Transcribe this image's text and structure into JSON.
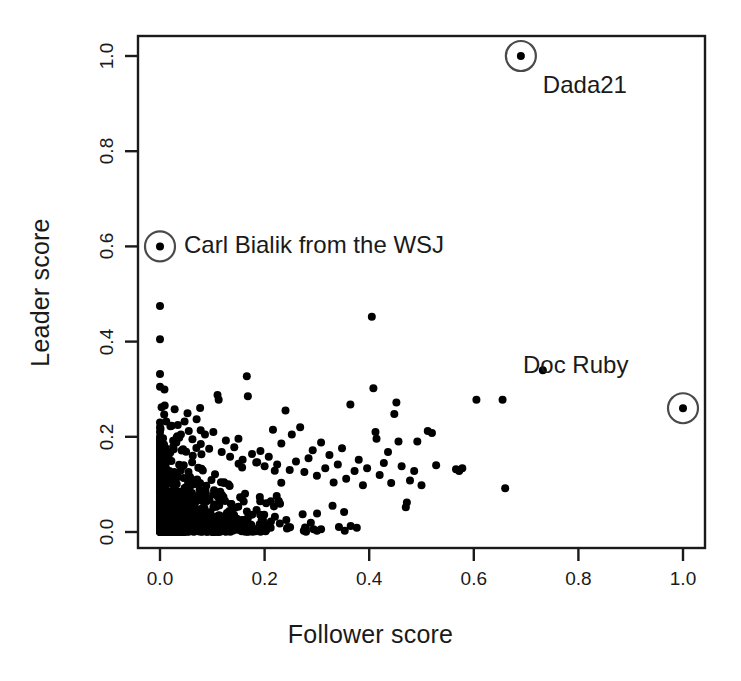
{
  "chart_data": {
    "type": "scatter",
    "title": "",
    "xlabel": "Follower score",
    "ylabel": "Leader score",
    "xlim": [
      -0.04,
      1.04
    ],
    "ylim": [
      -0.04,
      1.04
    ],
    "xticks": [
      "0.0",
      "0.2",
      "0.4",
      "0.6",
      "0.8",
      "1.0"
    ],
    "xtick_values": [
      0.0,
      0.2,
      0.4,
      0.6,
      0.8,
      1.0
    ],
    "yticks": [
      "0.0",
      "0.2",
      "0.4",
      "0.6",
      "0.8",
      "1.0"
    ],
    "ytick_values": [
      0.0,
      0.2,
      0.4,
      0.6,
      0.8,
      1.0
    ],
    "grid": false,
    "legend": "none",
    "marker": "filled-circle",
    "marker_color": "#000000",
    "frame_color": "#1a1a1a",
    "background": "#ffffff",
    "annotations": [
      {
        "label": "Dada21",
        "x": 0.69,
        "y": 1.0,
        "circled": true,
        "label_dx": 22,
        "label_dy": 30
      },
      {
        "label": "Carl Bialik from the WSJ",
        "x": 0.0,
        "y": 0.6,
        "circled": true,
        "label_dx": 24,
        "label_dy": 0
      },
      {
        "label": "Doc Ruby",
        "x": 1.0,
        "y": 0.26,
        "circled": true,
        "label_dx": -160,
        "label_dy": -42
      }
    ],
    "points": [
      [
        0.0,
        0.475
      ],
      [
        0.0,
        0.405
      ],
      [
        0.0,
        0.332
      ],
      [
        0.0,
        0.305
      ],
      [
        0.003,
        0.262
      ],
      [
        0.008,
        0.247
      ],
      [
        0.012,
        0.232
      ],
      [
        0.02,
        0.222
      ],
      [
        0.028,
        0.258
      ],
      [
        0.034,
        0.225
      ],
      [
        0.04,
        0.205
      ],
      [
        0.047,
        0.232
      ],
      [
        0.055,
        0.212
      ],
      [
        0.062,
        0.195
      ],
      [
        0.07,
        0.237
      ],
      [
        0.078,
        0.185
      ],
      [
        0.086,
        0.205
      ],
      [
        0.094,
        0.175
      ],
      [
        0.102,
        0.21
      ],
      [
        0.11,
        0.288
      ],
      [
        0.118,
        0.168
      ],
      [
        0.126,
        0.192
      ],
      [
        0.134,
        0.158
      ],
      [
        0.142,
        0.178
      ],
      [
        0.15,
        0.196
      ],
      [
        0.158,
        0.152
      ],
      [
        0.166,
        0.327
      ],
      [
        0.168,
        0.285
      ],
      [
        0.176,
        0.164
      ],
      [
        0.184,
        0.146
      ],
      [
        0.192,
        0.17
      ],
      [
        0.2,
        0.138
      ],
      [
        0.208,
        0.158
      ],
      [
        0.216,
        0.215
      ],
      [
        0.224,
        0.142
      ],
      [
        0.232,
        0.186
      ],
      [
        0.24,
        0.255
      ],
      [
        0.248,
        0.13
      ],
      [
        0.252,
        0.205
      ],
      [
        0.26,
        0.148
      ],
      [
        0.268,
        0.22
      ],
      [
        0.276,
        0.126
      ],
      [
        0.284,
        0.155
      ],
      [
        0.292,
        0.172
      ],
      [
        0.3,
        0.118
      ],
      [
        0.308,
        0.188
      ],
      [
        0.316,
        0.134
      ],
      [
        0.324,
        0.162
      ],
      [
        0.332,
        0.104
      ],
      [
        0.34,
        0.142
      ],
      [
        0.348,
        0.176
      ],
      [
        0.356,
        0.112
      ],
      [
        0.364,
        0.268
      ],
      [
        0.372,
        0.128
      ],
      [
        0.38,
        0.152
      ],
      [
        0.388,
        0.098
      ],
      [
        0.396,
        0.134
      ],
      [
        0.405,
        0.452
      ],
      [
        0.408,
        0.302
      ],
      [
        0.412,
        0.21
      ],
      [
        0.414,
        0.196
      ],
      [
        0.42,
        0.12
      ],
      [
        0.428,
        0.145
      ],
      [
        0.436,
        0.168
      ],
      [
        0.442,
        0.103
      ],
      [
        0.448,
        0.248
      ],
      [
        0.452,
        0.272
      ],
      [
        0.456,
        0.19
      ],
      [
        0.462,
        0.138
      ],
      [
        0.47,
        0.052
      ],
      [
        0.472,
        0.062
      ],
      [
        0.478,
        0.108
      ],
      [
        0.486,
        0.128
      ],
      [
        0.492,
        0.19
      ],
      [
        0.5,
        0.098
      ],
      [
        0.512,
        0.212
      ],
      [
        0.52,
        0.208
      ],
      [
        0.528,
        0.14
      ],
      [
        0.566,
        0.132
      ],
      [
        0.572,
        0.128
      ],
      [
        0.578,
        0.134
      ],
      [
        0.605,
        0.278
      ],
      [
        0.655,
        0.278
      ],
      [
        0.66,
        0.092
      ],
      [
        0.732,
        0.34
      ],
      [
        0.0,
        0.0
      ],
      [
        0.0,
        0.005
      ],
      [
        0.0,
        0.01
      ],
      [
        0.0,
        0.015
      ],
      [
        0.0,
        0.02
      ],
      [
        0.0,
        0.025
      ],
      [
        0.0,
        0.03
      ],
      [
        0.0,
        0.035
      ],
      [
        0.0,
        0.04
      ],
      [
        0.0,
        0.045
      ],
      [
        0.0,
        0.05
      ],
      [
        0.0,
        0.055
      ],
      [
        0.0,
        0.06
      ],
      [
        0.0,
        0.065
      ],
      [
        0.0,
        0.07
      ],
      [
        0.0,
        0.075
      ],
      [
        0.0,
        0.08
      ],
      [
        0.0,
        0.085
      ],
      [
        0.0,
        0.09
      ],
      [
        0.0,
        0.095
      ],
      [
        0.0,
        0.1
      ],
      [
        0.0,
        0.105
      ],
      [
        0.0,
        0.11
      ],
      [
        0.0,
        0.115
      ],
      [
        0.0,
        0.12
      ],
      [
        0.0,
        0.125
      ],
      [
        0.0,
        0.13
      ],
      [
        0.0,
        0.135
      ],
      [
        0.0,
        0.14
      ],
      [
        0.0,
        0.145
      ],
      [
        0.0,
        0.15
      ],
      [
        0.0,
        0.155
      ],
      [
        0.0,
        0.16
      ],
      [
        0.0,
        0.165
      ],
      [
        0.0,
        0.17
      ],
      [
        0.0,
        0.175
      ],
      [
        0.0,
        0.18
      ],
      [
        0.0,
        0.185
      ],
      [
        0.0,
        0.19
      ],
      [
        0.0,
        0.195
      ],
      [
        0.0,
        0.2
      ],
      [
        0.0,
        0.21
      ],
      [
        0.0,
        0.22
      ],
      [
        0.0,
        0.23
      ]
    ],
    "cluster": {
      "description": "dense saturated mass of points concentrated near the origin",
      "n_points": 1400,
      "x_decay": 0.055,
      "y_decay": 0.045,
      "x_max": 0.4,
      "y_max": 0.3,
      "seed": 20240521
    }
  }
}
